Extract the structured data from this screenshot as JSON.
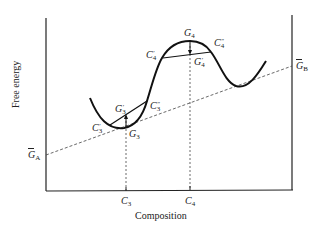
{
  "figure": {
    "type": "free-energy-composition-diagram",
    "y_axis_label": "Free energy",
    "x_axis_label": "Composition",
    "x_ticks": [
      {
        "label": "C",
        "sub": "3"
      },
      {
        "label": "C",
        "sub": "4"
      }
    ],
    "left_intercept": {
      "label": "G",
      "sub": "A",
      "bar": true
    },
    "right_intercept": {
      "label": "G",
      "sub": "B",
      "bar": true
    },
    "points": [
      {
        "id": "G3",
        "label": "G",
        "sub": "3",
        "prime": ""
      },
      {
        "id": "G3p",
        "label": "G",
        "sub": "3",
        "prime": "′"
      },
      {
        "id": "C3p",
        "label": "C",
        "sub": "3",
        "prime": "′"
      },
      {
        "id": "C3pp",
        "label": "C",
        "sub": "3",
        "prime": "″"
      },
      {
        "id": "G4",
        "label": "G",
        "sub": "4",
        "prime": ""
      },
      {
        "id": "G4p",
        "label": "G",
        "sub": "4",
        "prime": "′"
      },
      {
        "id": "C4p",
        "label": "C",
        "sub": "4",
        "prime": "′"
      },
      {
        "id": "C4pp",
        "label": "C",
        "sub": "4",
        "prime": "″"
      }
    ],
    "colors": {
      "ink": "#222222",
      "background": "#ffffff"
    }
  }
}
